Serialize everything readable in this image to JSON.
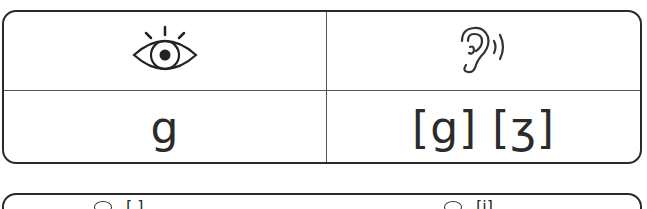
{
  "card": {
    "header": {
      "left_icon": "eye-icon",
      "right_icon": "ear-sound-icon"
    },
    "body": {
      "letter": "g",
      "sounds": "[g] [ʒ]"
    }
  },
  "next_card_partial": {
    "left_icon": "eye-icon",
    "left_text": "[ ]",
    "right_icon": "eye-icon",
    "right_text": "[i]"
  },
  "colors": {
    "stroke": "#2a2a2a",
    "text": "#2b2b2b",
    "background": "#ffffff"
  }
}
